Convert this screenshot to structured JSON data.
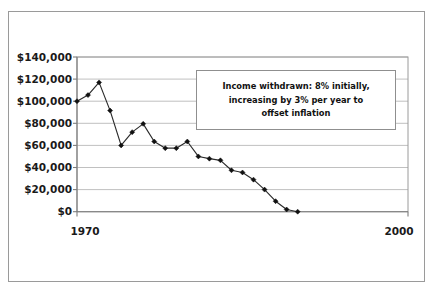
{
  "chart_data": {
    "type": "line",
    "title": "",
    "subtitle": "",
    "xlabel": "",
    "ylabel": "",
    "xlim": [
      1970,
      2000
    ],
    "ylim": [
      0,
      140000
    ],
    "grid": true,
    "legend": false,
    "legend_position": "none",
    "y_ticks": [
      0,
      20000,
      40000,
      60000,
      80000,
      100000,
      120000,
      140000
    ],
    "y_tick_labels": [
      "$0",
      "$20,000",
      "$40,000",
      "$60,000",
      "$80,000",
      "$100,000",
      "$120,000",
      "$140,000"
    ],
    "x_ticks": [
      1970,
      2000
    ],
    "x_tick_labels": [
      "1970",
      "2000"
    ],
    "marker": "diamond",
    "line_color": "#2b2b2b",
    "marker_color": "#111111",
    "grid_color": "#b9b9b9",
    "background_color": "#ffffff",
    "x": [
      1970,
      1971,
      1972,
      1973,
      1974,
      1975,
      1976,
      1977,
      1978,
      1979,
      1980,
      1981,
      1982,
      1983,
      1984,
      1985,
      1986,
      1987,
      1988,
      1989,
      1990,
      1991,
      1992,
      1993,
      1994,
      1995,
      1996,
      1997,
      1998,
      1999,
      2000
    ],
    "series": [
      {
        "name": "Portfolio value",
        "values": [
          100000,
          105500,
          117000,
          91500,
          60000,
          72000,
          79500,
          63500,
          57500,
          57500,
          63500,
          50000,
          48000,
          46500,
          37500,
          35500,
          29000,
          20000,
          9500,
          2000,
          0,
          0,
          0,
          0,
          0,
          0,
          0,
          0,
          0,
          0,
          0
        ]
      }
    ],
    "annotations": [
      {
        "name": "income-withdrawal-note",
        "lines": [
          "Income withdrawn: 8% initially,",
          "increasing by 3% per year to",
          "offset inflation"
        ],
        "text": "Income withdrawn: 8% initially, increasing by 3% per year to offset inflation",
        "boxed": true
      }
    ]
  },
  "figure": {
    "annotation_line_1": "Income withdrawn: 8% initially,",
    "annotation_line_2": "increasing by 3% per year to",
    "annotation_line_3": "offset inflation"
  },
  "axis": {
    "y_labels": {
      "t140": "$140,000",
      "t120": "$120,000",
      "t100": "$100,000",
      "t80": "$80,000",
      "t60": "$60,000",
      "t40": "$40,000",
      "t20": "$20,000",
      "t0": "$0"
    },
    "x_labels": {
      "left": "1970",
      "right": "2000"
    }
  }
}
